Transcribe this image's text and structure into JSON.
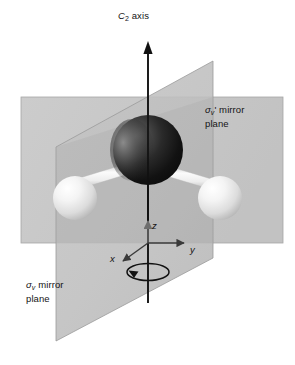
{
  "figure": {
    "title_text": "",
    "molecule": "water",
    "background_color": "#ffffff"
  },
  "labels": {
    "c2_axis": {
      "symbol": "C",
      "subscript": "2",
      "text": " axis",
      "full": "C2 axis"
    },
    "sigma_v_prime": {
      "symbol": "σ",
      "subscript": "v",
      "prime": "'",
      "line1_rest": " mirror",
      "line2": "plane",
      "full": "σv' mirror plane"
    },
    "sigma_v": {
      "symbol": "σ",
      "subscript": "v",
      "prime": "",
      "line1_rest": " mirror",
      "line2": "plane",
      "full": "σv mirror plane"
    },
    "axis_z": "z",
    "axis_y": "y",
    "axis_x": "x"
  },
  "colors": {
    "plane_light": "#c9c9c9",
    "plane_overlap": "#bdbdbd",
    "plane_dark": "#b4b4b4",
    "plane_edge": "#9a9a9a",
    "axis_black": "#111111",
    "axis_gray": "#6e6e6e",
    "oxygen_dark": "#141414",
    "oxygen_mid": "#4a4a4a",
    "hydrogen_light": "#f2f2f2",
    "hydrogen_shadow": "#bfbfbf",
    "bond_light": "#ededed",
    "text": "#141414"
  },
  "geometry": {
    "canvas": {
      "width": 295,
      "height": 365
    },
    "c2_axis": {
      "x": 148,
      "top_y": 42,
      "bottom_y": 303
    },
    "origin": {
      "x": 148,
      "y": 243
    },
    "sigma_v_prime_plane": {
      "left": 21,
      "right": 283,
      "top": 97,
      "bottom": 243
    },
    "sigma_v_plane": {
      "points": "56,147 213,61 213,258 56,341"
    },
    "oxygen": {
      "cx": 148,
      "cy": 150,
      "r": 35
    },
    "hydrogen_left": {
      "cx": 75,
      "cy": 198,
      "r": 22
    },
    "hydrogen_right": {
      "cx": 220,
      "cy": 198,
      "r": 22
    },
    "rotation_ellipse": {
      "cx": 148,
      "cy": 272,
      "rx": 21,
      "ry": 8
    },
    "axis_z_arrow": {
      "x": 148,
      "from_y": 243,
      "to_y": 214
    },
    "axis_y_arrow": {
      "y": 243,
      "from_x": 148,
      "to_x": 188
    },
    "axis_x_arrow": {
      "from_x": 148,
      "from_y": 243,
      "to_x": 119,
      "to_y": 264
    }
  }
}
